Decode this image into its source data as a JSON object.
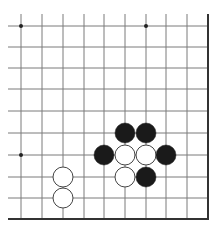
{
  "board": {
    "description": "Go board fragment (lower-right corner region)",
    "colors": {
      "background": "#ffffff",
      "grid_line": "#7a7a7a",
      "edge_line": "#333333",
      "black_stone": "#1a1a1a",
      "white_stone": "#ffffff",
      "stone_outline": "#444444",
      "star_point": "#222222"
    },
    "grid": {
      "x_lines": [
        21,
        42,
        63,
        84,
        104,
        125,
        146,
        166,
        187
      ],
      "y_lines": [
        26,
        47,
        68,
        89,
        111,
        133,
        155,
        177,
        198
      ],
      "right_edge_x": 208,
      "bottom_edge_y": 219,
      "line_start_x": 8,
      "line_start_y": 14
    },
    "star_points": [
      {
        "x": 21,
        "y": 26
      },
      {
        "x": 146,
        "y": 26
      },
      {
        "x": 21,
        "y": 155
      }
    ],
    "stone_radius": 10,
    "stones": [
      {
        "color": "black",
        "x": 125,
        "y": 133
      },
      {
        "color": "black",
        "x": 146,
        "y": 133
      },
      {
        "color": "black",
        "x": 104,
        "y": 155
      },
      {
        "color": "white",
        "x": 125,
        "y": 155
      },
      {
        "color": "white",
        "x": 146,
        "y": 155
      },
      {
        "color": "black",
        "x": 166,
        "y": 155
      },
      {
        "color": "white",
        "x": 125,
        "y": 177
      },
      {
        "color": "black",
        "x": 146,
        "y": 177
      },
      {
        "color": "white",
        "x": 63,
        "y": 177
      },
      {
        "color": "white",
        "x": 63,
        "y": 198
      }
    ]
  }
}
